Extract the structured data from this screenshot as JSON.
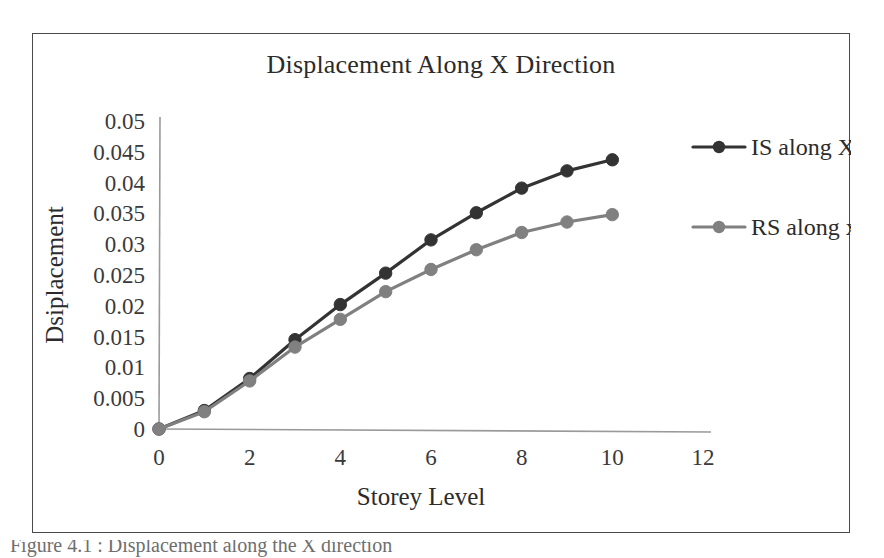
{
  "figure": {
    "background_color": "#ffffff",
    "frame_color": "#4a4a4a"
  },
  "caption": {
    "text": "Figure 4.1 : Displacement along the X direction"
  },
  "chart_data": {
    "type": "line",
    "title": "Displacement Along X Direction",
    "xlabel": "Storey Level",
    "ylabel": "Dsiplacement",
    "x": [
      0,
      1,
      2,
      3,
      4,
      5,
      6,
      7,
      8,
      9,
      10
    ],
    "xlim": [
      0,
      12
    ],
    "ylim": [
      0,
      0.05
    ],
    "xticks": [
      0,
      2,
      4,
      6,
      8,
      10,
      12
    ],
    "xtick_labels": [
      "0",
      "2",
      "4",
      "6",
      "8",
      "10",
      "12"
    ],
    "yticks": [
      0,
      0.005,
      0.01,
      0.015,
      0.02,
      0.025,
      0.03,
      0.035,
      0.04,
      0.045,
      0.05
    ],
    "ytick_labels": [
      "0",
      "0.005",
      "0.01",
      "0.015",
      "0.02",
      "0.025",
      "0.03",
      "0.035",
      "0.04",
      "0.045",
      "0.05"
    ],
    "grid": false,
    "legend_position": "right",
    "series": [
      {
        "name": "IS along X",
        "color": "#333333",
        "marker": "circle",
        "values": [
          0,
          0.003,
          0.0082,
          0.0145,
          0.0202,
          0.0253,
          0.0307,
          0.0351,
          0.0391,
          0.0419,
          0.0437
        ]
      },
      {
        "name": "RS along x",
        "color": "#808080",
        "marker": "circle",
        "values": [
          0,
          0.0028,
          0.0078,
          0.0133,
          0.0178,
          0.0223,
          0.0259,
          0.0291,
          0.0319,
          0.0336,
          0.0348
        ]
      }
    ]
  }
}
